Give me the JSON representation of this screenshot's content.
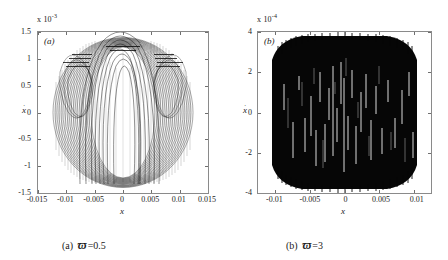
{
  "figure": {
    "panels": [
      {
        "id": "a",
        "panel_label": "(a)",
        "multiplier_prefix": "x 10",
        "multiplier_exponent": "-3",
        "caption_index": "(a)",
        "caption_symbol": "ϖ",
        "caption_value": "=0.5",
        "xlabel": "x",
        "ylabel": "x",
        "ylabel_dot": "·"
      },
      {
        "id": "b",
        "panel_label": "(b)",
        "multiplier_prefix": "x 10",
        "multiplier_exponent": "-4",
        "caption_index": "(b)",
        "caption_symbol": "ϖ",
        "caption_value": "=3",
        "xlabel": "x",
        "ylabel": "x",
        "ylabel_dot": "·"
      }
    ]
  },
  "chart_data": [
    {
      "type": "scatter",
      "panel": "a",
      "title": "(a)",
      "xlabel": "x",
      "ylabel": "x-dot",
      "x_multiplier": 1,
      "y_multiplier": 0.001,
      "xlim": [
        -0.015,
        0.015
      ],
      "ylim": [
        -0.0015,
        0.0015
      ],
      "xticks": [
        -0.015,
        -0.01,
        -0.005,
        0,
        0.005,
        0.01,
        0.015
      ],
      "xticklabels": [
        "-0.015",
        "-0.01",
        "-0.005",
        "0",
        "0.005",
        "0.01",
        "0.015"
      ],
      "yticks": [
        -0.0015,
        -0.001,
        -0.0005,
        0,
        0.0005,
        0.001,
        0.0015
      ],
      "yticklabels": [
        "-1.5",
        "-1",
        "-0.5",
        "0",
        "0.5",
        "1",
        "1.5"
      ],
      "grid": false,
      "legend": null,
      "description": "Dense quasi-periodic phase portrait of nested lobes; outer envelope spans x in [-0.0125, 0.0125] and x-dot in [-0.0014, 0.0014]; interior shows braided crossing loops with a multi-lobe structure near x = 0",
      "envelope_x_half_width": 0.0125,
      "envelope_y_half_height": 0.0014,
      "inner_lobe_count": 6,
      "outer_loop_count": 40
    },
    {
      "type": "scatter",
      "panel": "b",
      "title": "(b)",
      "xlabel": "x",
      "ylabel": "x-dot",
      "x_multiplier": 1,
      "y_multiplier": 0.0001,
      "xlim": [
        -0.0125,
        0.0125
      ],
      "ylim": [
        -0.0004,
        0.0004
      ],
      "xticks": [
        -0.01,
        -0.005,
        0,
        0.005,
        0.01
      ],
      "xticklabels": [
        "-0.01",
        "-0.005",
        "0",
        "0.005",
        "0.01"
      ],
      "yticks": [
        -0.0004,
        -0.0002,
        0,
        0.0002,
        0.0004
      ],
      "yticklabels": [
        "-4",
        "-2",
        "0",
        "2",
        "4"
      ],
      "grid": false,
      "legend": null,
      "description": "Fully filled chaotic band forming a near-rectangular dark region with rounded top and bottom corners; solid black fill with sparse narrow vertical white voids; spans x in [-0.0115, 0.0115] and x-dot in [-0.0004, 0.0004]",
      "envelope_x_half_width": 0.0115,
      "envelope_y_half_height": 0.0004,
      "fill_density": 0.95,
      "void_count": 45
    }
  ]
}
